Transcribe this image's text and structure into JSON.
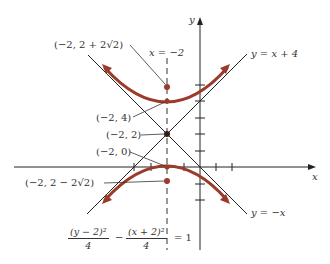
{
  "figure": {
    "type": "hyperbola-graph",
    "equation": {
      "term1_num": "(y − 2)²",
      "term1_den": "4",
      "minus": "−",
      "term2_num": "(x + 2)²",
      "term2_den": "4",
      "equals": "= 1"
    },
    "axes": {
      "x_label": "x",
      "y_label": "y"
    },
    "asymptotes": [
      {
        "label": "y = x + 4"
      },
      {
        "label": "y = −x"
      }
    ],
    "axis_of_symmetry": {
      "label": "x = −2"
    },
    "points": [
      {
        "label": "(−2, 2 + 2√2)",
        "role": "focus-upper",
        "x": -2,
        "y": 4.828
      },
      {
        "label": "(−2, 4)",
        "role": "vertex-upper",
        "x": -2,
        "y": 4
      },
      {
        "label": "(−2, 2)",
        "role": "center",
        "x": -2,
        "y": 2
      },
      {
        "label": "(−2, 0)",
        "role": "vertex-lower",
        "x": -2,
        "y": 0
      },
      {
        "label": "(−2, 2 − 2√2)",
        "role": "focus-lower",
        "x": -2,
        "y": -0.828
      }
    ],
    "colors": {
      "curve": "#9b3b2b",
      "lines": "#222222",
      "text": "#333333"
    }
  }
}
